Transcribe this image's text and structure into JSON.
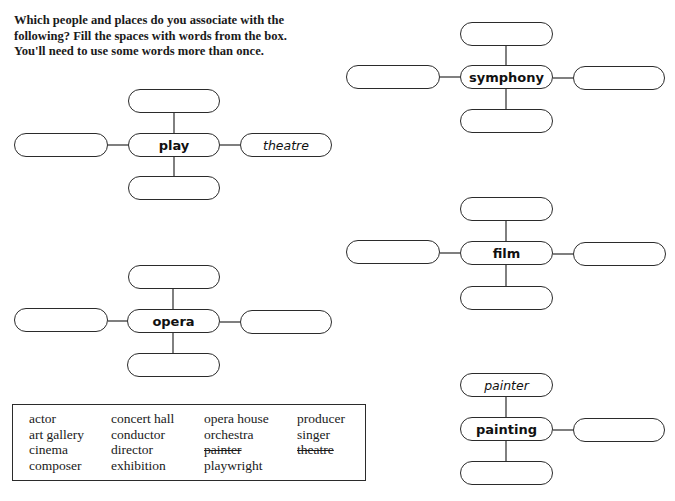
{
  "instructions": {
    "line1": "Which people and places do you associate with the",
    "line2": "following? Fill the spaces with words from the box.",
    "line3": "You'll need to use some words more than once."
  },
  "diagrams": {
    "play": {
      "center": "play",
      "top": "",
      "left": "",
      "right": "theatre",
      "bottom": ""
    },
    "symphony": {
      "center": "symphony",
      "top": "",
      "left": "",
      "right": "",
      "bottom": ""
    },
    "film": {
      "center": "film",
      "top": "",
      "left": "",
      "right": "",
      "bottom": ""
    },
    "opera": {
      "center": "opera",
      "top": "",
      "left": "",
      "right": "",
      "bottom": ""
    },
    "painting": {
      "center": "painting",
      "top": "painter",
      "right": "",
      "bottom": ""
    }
  },
  "word_box": {
    "columns": [
      [
        "actor",
        "art gallery",
        "cinema",
        "composer"
      ],
      [
        "concert hall",
        "conductor",
        "director",
        "exhibition"
      ],
      [
        "opera house",
        "orchestra",
        "painter",
        "playwright"
      ],
      [
        "producer",
        "singer",
        "theatre"
      ]
    ],
    "struck_words": [
      "painter",
      "theatre"
    ]
  },
  "colors": {
    "stroke": "#2b2b2b",
    "text": "#1a1a1a",
    "background": "#ffffff"
  }
}
